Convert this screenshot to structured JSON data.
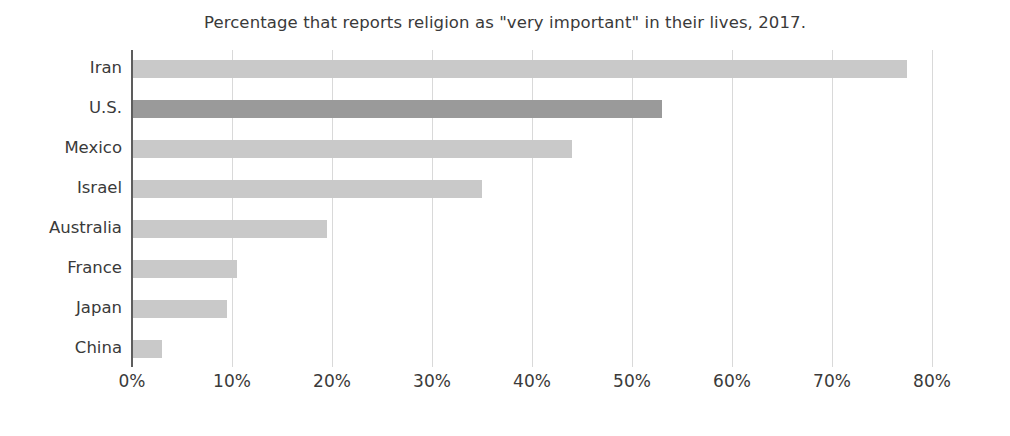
{
  "chart_data": {
    "type": "bar",
    "orientation": "horizontal",
    "title": "Percentage that reports religion as \"very important\" in their lives, 2017.",
    "xlabel": "",
    "ylabel": "",
    "categories": [
      "Iran",
      "U.S.",
      "Mexico",
      "Israel",
      "Australia",
      "France",
      "Japan",
      "China"
    ],
    "values": [
      77.5,
      53,
      44,
      35,
      19.5,
      10.5,
      9.5,
      3
    ],
    "xlim": [
      0,
      80
    ],
    "xticks": [
      0,
      10,
      20,
      30,
      40,
      50,
      60,
      70,
      80
    ],
    "xtick_labels": [
      "0%",
      "10%",
      "20%",
      "30%",
      "40%",
      "50%",
      "60%",
      "70%",
      "80%"
    ],
    "grid": "vertical",
    "legend": "none",
    "bars": [
      {
        "label": "Iran",
        "value": 77.5,
        "color": "#c9c9c9",
        "highlight": false
      },
      {
        "label": "U.S.",
        "value": 53.0,
        "color": "#9a9a9a",
        "highlight": true
      },
      {
        "label": "Mexico",
        "value": 44.0,
        "color": "#c9c9c9",
        "highlight": false
      },
      {
        "label": "Israel",
        "value": 35.0,
        "color": "#c9c9c9",
        "highlight": false
      },
      {
        "label": "Australia",
        "value": 19.5,
        "color": "#c9c9c9",
        "highlight": false
      },
      {
        "label": "France",
        "value": 10.5,
        "color": "#c9c9c9",
        "highlight": false
      },
      {
        "label": "Japan",
        "value": 9.5,
        "color": "#c9c9c9",
        "highlight": false
      },
      {
        "label": "China",
        "value": 3.0,
        "color": "#c9c9c9",
        "highlight": false
      }
    ],
    "colors": {
      "bar_default": "#c9c9c9",
      "bar_highlight": "#9a9a9a",
      "gridline": "#d9d9d9",
      "axis": "#5d5d5d",
      "text": "#3a3a3a",
      "background": "#ffffff"
    }
  }
}
